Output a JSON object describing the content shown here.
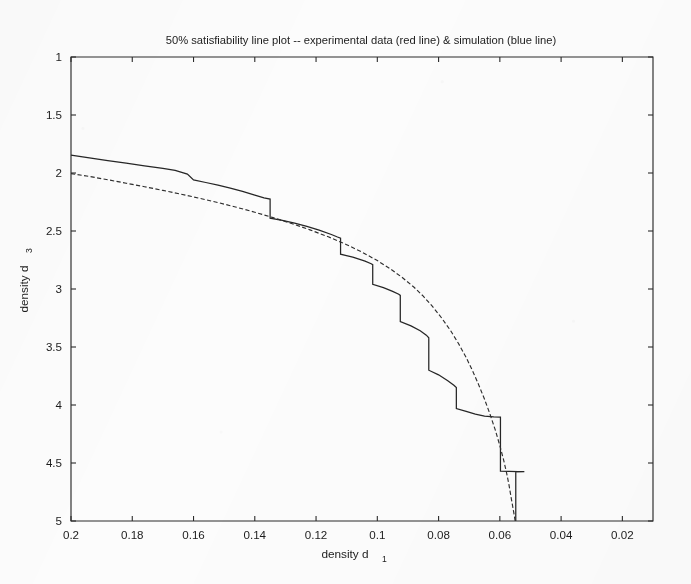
{
  "figure": {
    "width": 691,
    "height": 584,
    "background_color": "#fcfcfc",
    "ink_color": "#262626"
  },
  "chart_data": {
    "type": "line",
    "title": "50% satisfiability line plot -- experimental data (red line) & simulation (blue line)",
    "xlabel": "density d",
    "xlabel_sub": "1",
    "ylabel": "density d",
    "ylabel_sub": "3",
    "xlim": [
      0.2,
      0.01
    ],
    "ylim": [
      1,
      5
    ],
    "x_axis_reversed": true,
    "y_axis_reversed": true,
    "grid": false,
    "legend_position": "none",
    "legend_in_title": true,
    "xticks": [
      0.2,
      0.18,
      0.16,
      0.14,
      0.12,
      0.1,
      0.08,
      0.06,
      0.04,
      0.02
    ],
    "xticklabels": [
      "0.2",
      "0.18",
      "0.16",
      "0.14",
      "0.12",
      "0.1",
      "0.08",
      "0.06",
      "0.04",
      "0.02"
    ],
    "yticks": [
      1,
      1.5,
      2,
      2.5,
      3,
      3.5,
      4,
      4.5,
      5
    ],
    "yticklabels": [
      "1",
      "1.5",
      "2",
      "2.5",
      "3",
      "3.5",
      "4",
      "4.5",
      "5"
    ],
    "series": [
      {
        "name": "experimental data (red line)",
        "style": "solid-step",
        "description": "staircase curve of experimental 50% satisfiability threshold",
        "points": [
          [
            0.2,
            1.845
          ],
          [
            0.194,
            1.87
          ],
          [
            0.188,
            1.893
          ],
          [
            0.182,
            1.915
          ],
          [
            0.176,
            1.938
          ],
          [
            0.17,
            1.96
          ],
          [
            0.166,
            1.978
          ],
          [
            0.162,
            2.01
          ],
          [
            0.16,
            2.06
          ],
          [
            0.156,
            2.082
          ],
          [
            0.152,
            2.105
          ],
          [
            0.148,
            2.13
          ],
          [
            0.144,
            2.158
          ],
          [
            0.14,
            2.19
          ],
          [
            0.137,
            2.215
          ],
          [
            0.135,
            2.225
          ],
          [
            0.135,
            2.39
          ],
          [
            0.131,
            2.408
          ],
          [
            0.127,
            2.432
          ],
          [
            0.123,
            2.46
          ],
          [
            0.119,
            2.492
          ],
          [
            0.115,
            2.53
          ],
          [
            0.113,
            2.552
          ],
          [
            0.112,
            2.562
          ],
          [
            0.112,
            2.7
          ],
          [
            0.108,
            2.726
          ],
          [
            0.104,
            2.76
          ],
          [
            0.102,
            2.782
          ],
          [
            0.1015,
            2.79
          ],
          [
            0.1015,
            2.96
          ],
          [
            0.098,
            2.988
          ],
          [
            0.095,
            3.02
          ],
          [
            0.093,
            3.045
          ],
          [
            0.0925,
            3.055
          ],
          [
            0.0925,
            3.28
          ],
          [
            0.089,
            3.318
          ],
          [
            0.086,
            3.36
          ],
          [
            0.084,
            3.398
          ],
          [
            0.0832,
            3.42
          ],
          [
            0.0832,
            3.7
          ],
          [
            0.08,
            3.74
          ],
          [
            0.077,
            3.79
          ],
          [
            0.075,
            3.83
          ],
          [
            0.0742,
            3.85
          ],
          [
            0.0742,
            4.03
          ],
          [
            0.071,
            4.055
          ],
          [
            0.068,
            4.078
          ],
          [
            0.065,
            4.095
          ],
          [
            0.062,
            4.102
          ],
          [
            0.0598,
            4.105
          ],
          [
            0.0598,
            4.57
          ],
          [
            0.057,
            4.572
          ],
          [
            0.054,
            4.574
          ],
          [
            0.052,
            4.575
          ],
          [
            0.0548,
            4.576
          ],
          [
            0.0548,
            5.0
          ]
        ]
      },
      {
        "name": "simulation (blue line)",
        "style": "dashed-smooth",
        "description": "smooth dash-dot simulation curve of predicted threshold",
        "points": [
          [
            0.2,
            2.005
          ],
          [
            0.194,
            2.03
          ],
          [
            0.188,
            2.058
          ],
          [
            0.182,
            2.088
          ],
          [
            0.176,
            2.118
          ],
          [
            0.17,
            2.15
          ],
          [
            0.164,
            2.183
          ],
          [
            0.158,
            2.218
          ],
          [
            0.152,
            2.255
          ],
          [
            0.146,
            2.295
          ],
          [
            0.14,
            2.338
          ],
          [
            0.134,
            2.385
          ],
          [
            0.128,
            2.435
          ],
          [
            0.122,
            2.49
          ],
          [
            0.116,
            2.55
          ],
          [
            0.11,
            2.618
          ],
          [
            0.105,
            2.682
          ],
          [
            0.1,
            2.755
          ],
          [
            0.096,
            2.822
          ],
          [
            0.092,
            2.898
          ],
          [
            0.088,
            2.985
          ],
          [
            0.085,
            3.062
          ],
          [
            0.082,
            3.15
          ],
          [
            0.079,
            3.25
          ],
          [
            0.076,
            3.362
          ],
          [
            0.0735,
            3.47
          ],
          [
            0.071,
            3.59
          ],
          [
            0.069,
            3.7
          ],
          [
            0.067,
            3.82
          ],
          [
            0.065,
            3.95
          ],
          [
            0.0632,
            4.08
          ],
          [
            0.0615,
            4.215
          ],
          [
            0.06,
            4.35
          ],
          [
            0.0588,
            4.47
          ],
          [
            0.0578,
            4.585
          ],
          [
            0.057,
            4.69
          ],
          [
            0.0564,
            4.785
          ],
          [
            0.0558,
            4.875
          ],
          [
            0.0553,
            4.95
          ],
          [
            0.055,
            5.0
          ]
        ]
      }
    ]
  }
}
